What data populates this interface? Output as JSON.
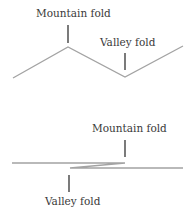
{
  "diagram": {
    "top": {
      "mountain_label": "Mountain fold",
      "valley_label": "Valley fold",
      "line_color": "#a0a0a0",
      "tick_color": "#333333"
    },
    "bottom": {
      "mountain_label": "Mountain fold",
      "valley_label": "Valley fold",
      "line_color": "#a0a0a0",
      "tick_color": "#333333"
    }
  }
}
